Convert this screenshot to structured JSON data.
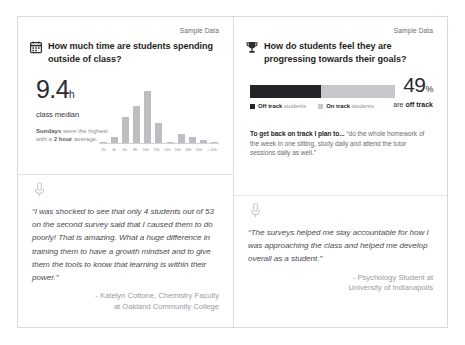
{
  "left_panel": {
    "sample_label": "Sample Data",
    "icon": "calendar-icon",
    "question": "How much time are students spending outside of class?",
    "stat": {
      "value": "9.4",
      "unit": "h",
      "caption": "class median",
      "note_lead": "Sundays",
      "note_mid": " were the highest with a ",
      "note_bold": "2 hour",
      "note_tail": " average."
    },
    "quote": {
      "icon": "microphone-icon",
      "text": "“I was shocked to see that only 4 students out of 53 on the second survey said that I caused them to do poorly! That is amazing. What a huge difference in training them to have a growth mindset and to give them the tools to know that learning is within their power.”",
      "attribution_line1": "- Katelyn Cottone, Chemistry Faculty",
      "attribution_line2": "at Oakland Community College"
    }
  },
  "right_panel": {
    "sample_label": "Sample Data",
    "icon": "trophy-icon",
    "question": "How do students feel they are progressing towards their goals?",
    "stat": {
      "value": "49",
      "unit": "%",
      "caption_lead": "are ",
      "caption_bold": "off track"
    },
    "legend": [
      {
        "label_bold": "Off track",
        "label_rest": " students",
        "color": "#242428"
      },
      {
        "label_bold": "On track",
        "label_rest": " students",
        "color": "#c6c6cb"
      }
    ],
    "plan": {
      "lead": "To get back on track I plan to...",
      "quote": " “do the whole homework of the week in one sitting, study daily and attend the tutor sessions daily as well.”"
    },
    "quote": {
      "icon": "microphone-icon",
      "text": "“The surveys helped me stay accountable for how I was approaching the class and helped me develop overall as a student.”",
      "attribution_line1": "- Psychology Student at",
      "attribution_line2": "University of Indianapolis"
    }
  },
  "chart_data": {
    "type": "bar",
    "xlabel": "",
    "ylabel": "",
    "grid": false,
    "legend": "none",
    "bar_color": "#bdbdc2",
    "categories": [
      "2h",
      "4h",
      "6h",
      "8h",
      "10h",
      "12h",
      "14h",
      "16h",
      "18h",
      "20h",
      "+ 20h"
    ],
    "values": [
      1,
      6,
      25,
      36,
      50,
      19,
      1,
      9,
      6,
      3,
      1
    ],
    "ylim": [
      0,
      55
    ]
  },
  "progress_data": {
    "type": "bar",
    "orientation": "stacked-horizontal",
    "categories": [
      "Off track students",
      "On track students"
    ],
    "values": [
      49,
      51
    ],
    "colors": [
      "#242428",
      "#c6c6cb"
    ],
    "unit": "%"
  }
}
